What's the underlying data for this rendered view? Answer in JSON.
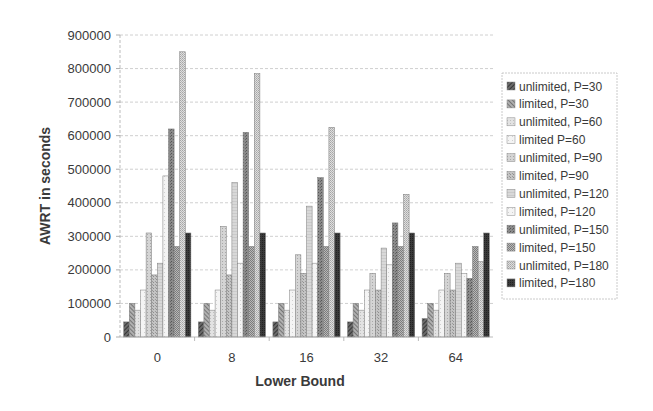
{
  "chart_data": {
    "type": "bar",
    "title": "",
    "xlabel": "Lower Bound",
    "ylabel": "AWRT in seconds",
    "ylim": [
      0,
      900000
    ],
    "yticks": [
      0,
      100000,
      200000,
      300000,
      400000,
      500000,
      600000,
      700000,
      800000,
      900000
    ],
    "ytick_labels": [
      "0",
      "100000",
      "200000",
      "300000",
      "400000",
      "500000",
      "600000",
      "700000",
      "800000",
      "900000"
    ],
    "grid": true,
    "legend_position": "right",
    "categories": [
      "0",
      "8",
      "16",
      "32",
      "64"
    ],
    "series": [
      {
        "name": "unlimited, P=30",
        "color": "#555555",
        "pattern": "diag-dense-dark",
        "values": [
          45000,
          45000,
          45000,
          45000,
          55000
        ]
      },
      {
        "name": "limited, P=30",
        "color": "#8a8a8a",
        "pattern": "diag-dark",
        "values": [
          100000,
          100000,
          100000,
          100000,
          100000
        ]
      },
      {
        "name": "unlimited, P=60",
        "color": "#d8d8d8",
        "pattern": "light",
        "values": [
          80000,
          80000,
          80000,
          80000,
          80000
        ]
      },
      {
        "name": "limited P=60",
        "color": "#efefef",
        "pattern": "light-open",
        "values": [
          140000,
          140000,
          140000,
          140000,
          140000
        ]
      },
      {
        "name": "unlimited, P=90",
        "color": "#c8c8c8",
        "pattern": "light-dots",
        "values": [
          310000,
          330000,
          245000,
          190000,
          190000
        ]
      },
      {
        "name": "limited, P=90",
        "color": "#bdbdbd",
        "pattern": "mid-dots",
        "values": [
          185000,
          185000,
          190000,
          140000,
          140000
        ]
      },
      {
        "name": "unlimited, P=120",
        "color": "#cfcfcf",
        "pattern": "light-grid",
        "values": [
          220000,
          460000,
          390000,
          265000,
          220000
        ]
      },
      {
        "name": "limited, P=120",
        "color": "#e6e6e6",
        "pattern": "light-open",
        "values": [
          480000,
          220000,
          220000,
          215000,
          190000
        ]
      },
      {
        "name": "unlimited, P=150",
        "color": "#8c8c8c",
        "pattern": "dark-dots",
        "values": [
          620000,
          610000,
          475000,
          340000,
          175000
        ]
      },
      {
        "name": "limited, P=150",
        "color": "#a8a8a8",
        "pattern": "mid-checker",
        "values": [
          270000,
          270000,
          270000,
          270000,
          270000
        ]
      },
      {
        "name": "unlimited, P=180",
        "color": "#d0d0d0",
        "pattern": "light-checker",
        "values": [
          850000,
          785000,
          625000,
          425000,
          225000
        ]
      },
      {
        "name": "limited, P=180",
        "color": "#333333",
        "pattern": "solid-dark",
        "values": [
          310000,
          310000,
          310000,
          310000,
          310000
        ]
      }
    ]
  }
}
